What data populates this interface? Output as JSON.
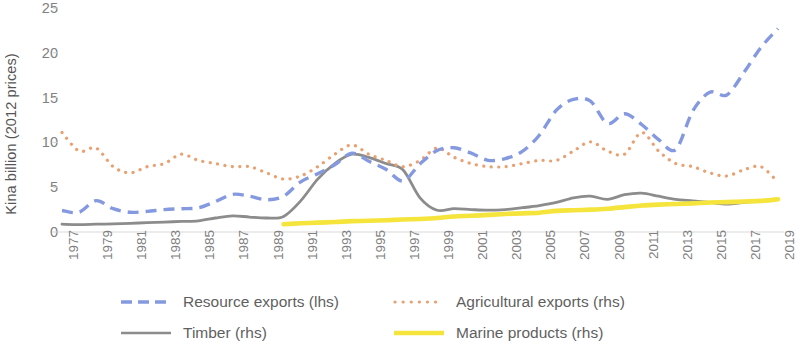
{
  "chart_data": {
    "type": "line",
    "title": "",
    "subtitle": "",
    "xlabel": "",
    "ylabel": "Kina billion (2012 prices)",
    "ylim": [
      0,
      25
    ],
    "yticks": [
      0,
      5,
      10,
      15,
      20,
      25
    ],
    "ytick_labels": [
      "0",
      "5",
      "10",
      "15",
      "20",
      "25"
    ],
    "grid": false,
    "legend_position": "bottom",
    "x": [
      1977,
      1978,
      1979,
      1980,
      1981,
      1982,
      1983,
      1984,
      1985,
      1986,
      1987,
      1988,
      1989,
      1990,
      1991,
      1992,
      1993,
      1994,
      1995,
      1996,
      1997,
      1998,
      1999,
      2000,
      2001,
      2002,
      2003,
      2004,
      2005,
      2006,
      2007,
      2008,
      2009,
      2010,
      2011,
      2012,
      2013,
      2014,
      2015,
      2016,
      2017,
      2018,
      2019
    ],
    "xtick_labels": [
      "1977",
      "1979",
      "1981",
      "1983",
      "1985",
      "1987",
      "1989",
      "1991",
      "1993",
      "1995",
      "1997",
      "1999",
      "2001",
      "2003",
      "2005",
      "2007",
      "2009",
      "2011",
      "2013",
      "2015",
      "2017",
      "2019"
    ],
    "series": [
      {
        "name": "Resource exports (lhs)",
        "axis": "lhs",
        "style": "dashed",
        "color": "#8599e0",
        "values": [
          2.4,
          2.2,
          3.5,
          2.6,
          2.2,
          2.3,
          2.5,
          2.6,
          2.7,
          3.4,
          4.2,
          4.0,
          3.6,
          4.0,
          5.6,
          6.5,
          7.5,
          8.8,
          7.9,
          7.0,
          5.7,
          7.6,
          9.1,
          9.4,
          8.8,
          8.0,
          8.2,
          9.0,
          10.8,
          13.6,
          14.8,
          14.6,
          12.1,
          13.2,
          12.0,
          10.3,
          9.2,
          13.5,
          15.6,
          15.3,
          17.8,
          20.6,
          22.7
        ]
      },
      {
        "name": "Agricultural exports (rhs)",
        "axis": "rhs",
        "style": "dotted",
        "color": "#e8a172",
        "values": [
          3.2,
          2.6,
          2.7,
          2.1,
          1.9,
          2.1,
          2.2,
          2.5,
          2.3,
          2.2,
          2.1,
          2.1,
          1.9,
          1.7,
          1.8,
          2.1,
          2.5,
          2.8,
          2.5,
          2.3,
          2.1,
          2.3,
          2.7,
          2.4,
          2.2,
          2.1,
          2.1,
          2.2,
          2.3,
          2.3,
          2.6,
          2.9,
          2.6,
          2.5,
          3.2,
          2.6,
          2.2,
          2.1,
          1.9,
          1.8,
          2.0,
          2.1,
          1.6
        ]
      },
      {
        "name": "Timber (rhs)",
        "axis": "rhs",
        "style": "solid",
        "color": "#8c8c8c",
        "values": [
          0.25,
          0.24,
          0.25,
          0.26,
          0.28,
          0.3,
          0.32,
          0.34,
          0.36,
          0.45,
          0.52,
          0.48,
          0.45,
          0.5,
          1.0,
          1.7,
          2.2,
          2.5,
          2.4,
          2.2,
          2.0,
          1.1,
          0.7,
          0.75,
          0.72,
          0.7,
          0.72,
          0.78,
          0.85,
          0.95,
          1.1,
          1.15,
          1.05,
          1.2,
          1.25,
          1.15,
          1.05,
          1.0,
          0.95,
          0.9,
          0.95,
          1.0,
          1.05
        ]
      },
      {
        "name": "Marine products (rhs)",
        "axis": "rhs",
        "style": "solid-thick",
        "color": "#f5e43c",
        "values": [
          null,
          null,
          null,
          null,
          null,
          null,
          null,
          null,
          null,
          null,
          null,
          null,
          null,
          0.25,
          0.28,
          0.3,
          0.32,
          0.35,
          0.36,
          0.38,
          0.4,
          0.42,
          0.45,
          0.5,
          0.52,
          0.55,
          0.58,
          0.6,
          0.62,
          0.68,
          0.7,
          0.72,
          0.75,
          0.8,
          0.85,
          0.88,
          0.9,
          0.92,
          0.95,
          0.96,
          0.98,
          1.0,
          1.05
        ]
      }
    ]
  },
  "axis": {
    "y_title": "Kina billion (2012 prices)"
  },
  "legend": {
    "items": [
      {
        "label": "Resource exports (lhs)",
        "color": "#8599e0",
        "icon": "dashed-line-icon"
      },
      {
        "label": "Agricultural exports (rhs)",
        "color": "#e8a172",
        "icon": "dotted-line-icon"
      },
      {
        "label": "Timber (rhs)",
        "color": "#8c8c8c",
        "icon": "solid-line-icon"
      },
      {
        "label": "Marine products (rhs)",
        "color": "#f5e43c",
        "icon": "thick-line-icon"
      }
    ]
  }
}
